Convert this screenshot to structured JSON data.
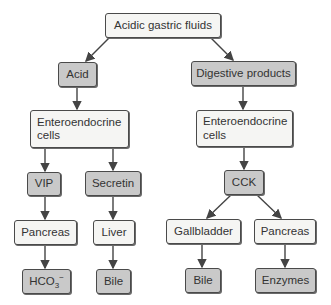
{
  "diagram": {
    "colors": {
      "light_fill": "#f5f5f3",
      "dark_fill": "#c9c9c9",
      "stroke": "#4a4a4a"
    },
    "nodes": {
      "root": "Acidic gastric fluids",
      "acid": "Acid",
      "digestive": "Digestive products",
      "entero_left": "Enteroendocrine cells",
      "entero_right": "Enteroendocrine cells",
      "vip": "VIP",
      "secretin": "Secretin",
      "cck": "CCK",
      "pancreas_left": "Pancreas",
      "liver": "Liver",
      "gallbladder": "Gallbladder",
      "pancreas_right": "Pancreas",
      "hco3_base": "HCO",
      "hco3_sub": "3",
      "hco3_sup": "−",
      "bile_left": "Bile",
      "bile_right": "Bile",
      "enzymes": "Enzymes"
    },
    "edges": [
      [
        "Acidic gastric fluids",
        "Acid"
      ],
      [
        "Acidic gastric fluids",
        "Digestive products"
      ],
      [
        "Acid",
        "Enteroendocrine cells (left)"
      ],
      [
        "Digestive products",
        "Enteroendocrine cells (right)"
      ],
      [
        "Enteroendocrine cells (left)",
        "VIP"
      ],
      [
        "Enteroendocrine cells (left)",
        "Secretin"
      ],
      [
        "Enteroendocrine cells (right)",
        "CCK"
      ],
      [
        "VIP",
        "Pancreas (left)"
      ],
      [
        "Secretin",
        "Liver"
      ],
      [
        "CCK",
        "Gallbladder"
      ],
      [
        "CCK",
        "Pancreas (right)"
      ],
      [
        "Pancreas (left)",
        "HCO3-"
      ],
      [
        "Liver",
        "Bile (left)"
      ],
      [
        "Gallbladder",
        "Bile (right)"
      ],
      [
        "Pancreas (right)",
        "Enzymes"
      ]
    ]
  }
}
